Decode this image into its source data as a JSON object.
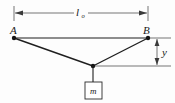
{
  "figure": {
    "type": "free-body-diagram",
    "background_color": "#fdfdfd",
    "line_color": "#1f1f1f",
    "labels": {
      "support_left": "A",
      "support_right": "B",
      "span_symbol": "l",
      "span_subscript": "o",
      "sag_symbol": "y",
      "mass_symbol": "m"
    },
    "geometry": {
      "support_left_point": {
        "x": 14,
        "y": 38
      },
      "support_right_point": {
        "x": 148,
        "y": 38
      },
      "junction_point": {
        "x": 93,
        "y": 66
      },
      "span_dimension_y": 13,
      "sag_dimension_x": 157,
      "mass_box": {
        "x": 85,
        "y": 82,
        "width": 17,
        "height": 17
      }
    },
    "dimensions": [
      {
        "name": "span",
        "label": "l_o",
        "orientation": "horizontal",
        "from": 14,
        "to": 148
      },
      {
        "name": "sag",
        "label": "y",
        "orientation": "vertical",
        "from": 38,
        "to": 66
      }
    ]
  }
}
